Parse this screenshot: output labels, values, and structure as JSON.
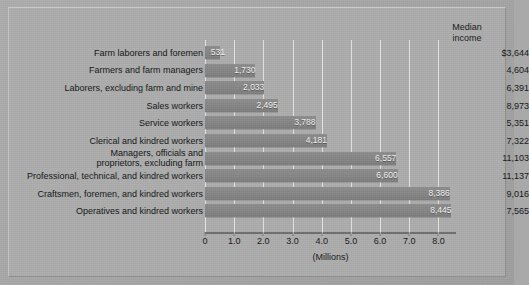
{
  "chart_data": {
    "type": "bar",
    "orientation": "horizontal",
    "title": "",
    "xlabel": "(Millions)",
    "ylabel": "",
    "xlim": [
      0,
      8.6
    ],
    "xticks": [
      "0",
      "1.0",
      "2.0",
      "3.0",
      "4.0",
      "5.0",
      "6.0",
      "7.0",
      "8.0"
    ],
    "xtick_values": [
      0,
      1,
      2,
      3,
      4,
      5,
      6,
      7,
      8
    ],
    "grid": true,
    "legend": "none",
    "categories": [
      "Farm laborers and foremen",
      "Farmers and farm managers",
      "Laborers, excluding farm and mine",
      "Sales workers",
      "Service workers",
      "Clerical and kindred workers",
      "Managers, officials and\nproprietors, excluding farm",
      "Professional, technical, and kindred workers",
      "Craftsmen, foremen, and kindred workers",
      "Operatives and kindred workers"
    ],
    "values": [
      531,
      1730,
      2033,
      2495,
      3788,
      4181,
      6557,
      6600,
      8386,
      8445
    ],
    "value_labels": [
      "531",
      "1,730",
      "2,033",
      "2,495",
      "3,788",
      "4,181",
      "6,557",
      "6,600",
      "8,386",
      "8,445"
    ],
    "secondary_column": {
      "header": "Median\nincome",
      "header_line1": "Median",
      "header_line2": "income",
      "values": [
        "$3,644",
        "4,604",
        "6,391",
        "8,973",
        "5,351",
        "7,322",
        "11,103",
        "11,137",
        "9,016",
        "7,565"
      ]
    },
    "colors": {
      "background": "#adadad",
      "bar": "#868686",
      "gridline": "#e4e4e4",
      "axis": "#6e6e6e",
      "text": "#17181a",
      "bar_label_text": "#f4f4f4"
    }
  }
}
